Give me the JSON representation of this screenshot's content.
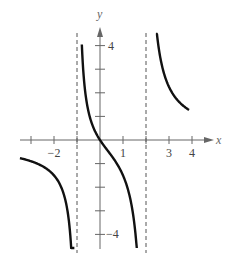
{
  "chart_data": {
    "type": "line",
    "title": "",
    "function": "y = 3x / ((x + 1)(x - 2))",
    "xlabel": "x",
    "ylabel": "y",
    "xlim": [
      -3.5,
      4.5
    ],
    "ylim": [
      -4.6,
      4.6
    ],
    "grid": false,
    "x_ticks": [
      -3,
      -2,
      -1,
      1,
      2,
      3,
      4
    ],
    "x_tick_labels": [
      {
        "value": -2,
        "label": "−2"
      },
      {
        "value": 1,
        "label": "1"
      },
      {
        "value": 3,
        "label": "3"
      },
      {
        "value": 4,
        "label": "4"
      }
    ],
    "y_ticks": [
      -4,
      -3,
      -2,
      -1,
      1,
      2,
      3,
      4
    ],
    "y_tick_labels": [
      {
        "value": 4,
        "label": "4"
      },
      {
        "value": -4,
        "label": "−4"
      }
    ],
    "vertical_asymptotes": [
      -1,
      2
    ],
    "series": [
      {
        "name": "left branch",
        "x": [
          -3.48,
          -3.0,
          -2.5,
          -2.0,
          -1.75,
          -1.5,
          -1.35,
          -1.2,
          -1.1
        ],
        "y": [
          -0.78,
          -0.9,
          -1.11,
          -1.5,
          -1.83,
          -2.57,
          -3.45,
          -5.6,
          -9.5
        ]
      },
      {
        "name": "middle branch",
        "x": [
          -0.78,
          -0.6,
          -0.4,
          -0.2,
          0,
          0.25,
          0.5,
          0.75,
          1.0,
          1.25,
          1.5,
          1.6
        ],
        "y": [
          3.83,
          1.73,
          0.83,
          0.34,
          0,
          -0.35,
          -0.67,
          -1.03,
          -1.5,
          -2.22,
          -3.6,
          -4.62
        ]
      },
      {
        "name": "right branch",
        "x": [
          2.43,
          2.6,
          2.8,
          3.0,
          3.25,
          3.5,
          3.87
        ],
        "y": [
          4.94,
          3.55,
          2.66,
          2.25,
          1.75,
          1.45,
          1.27
        ]
      }
    ]
  },
  "axes": {
    "x_label": "x",
    "y_label": "y"
  }
}
